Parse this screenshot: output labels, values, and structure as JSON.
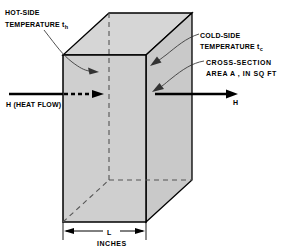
{
  "figure": {
    "type": "technical-diagram",
    "background_color": "#ffffff",
    "line_color": "#000000",
    "face_fill_front": "#cfcfcf",
    "face_fill_side": "#c9c9c9",
    "face_fill_top": "#d6d6d6"
  },
  "labels": {
    "hot_side_line1": "HOT-SIDE",
    "hot_side_line2": "TEMPERATURE t",
    "hot_side_subscript": "h",
    "cold_side_line1": "COLD-SIDE",
    "cold_side_line2": "TEMPERATURE t",
    "cold_side_subscript": "c",
    "cross_section_line1": "CROSS-SECTION",
    "cross_section_line2": "AREA A , IN SQ FT",
    "heat_flow_left": "H (HEAT FLOW)",
    "heat_flow_right": "H",
    "dimension_length": "L",
    "dimension_units": "INCHES"
  },
  "geometry": {
    "front_face": {
      "top_left": [
        63,
        55
      ],
      "top_right": [
        146,
        55
      ],
      "bottom_right": [
        146,
        222
      ],
      "bottom_left": [
        63,
        222
      ]
    },
    "depth_offset": [
      46,
      -42
    ],
    "hidden_edges": [
      "rear-vertical",
      "rear-bottom-horizontal",
      "bottom-left-diagonal"
    ]
  },
  "arrows": {
    "heat_in": {
      "solid_from": [
        9,
        94
      ],
      "solid_to": [
        63,
        94
      ],
      "dashed_to": [
        103,
        94
      ]
    },
    "heat_out": {
      "from": [
        155,
        94
      ],
      "to": [
        236,
        94
      ]
    },
    "leader_hot": {
      "from": [
        45,
        28
      ],
      "to": [
        95,
        70
      ]
    },
    "leader_cold": {
      "from": [
        198,
        35
      ],
      "to": [
        152,
        62
      ]
    },
    "leader_area": {
      "from": [
        203,
        62
      ],
      "to": [
        152,
        88
      ]
    }
  },
  "dimension_line": {
    "y": 231,
    "left_x": 63,
    "right_x": 146,
    "tick_top": 222,
    "tick_bottom": 240
  }
}
